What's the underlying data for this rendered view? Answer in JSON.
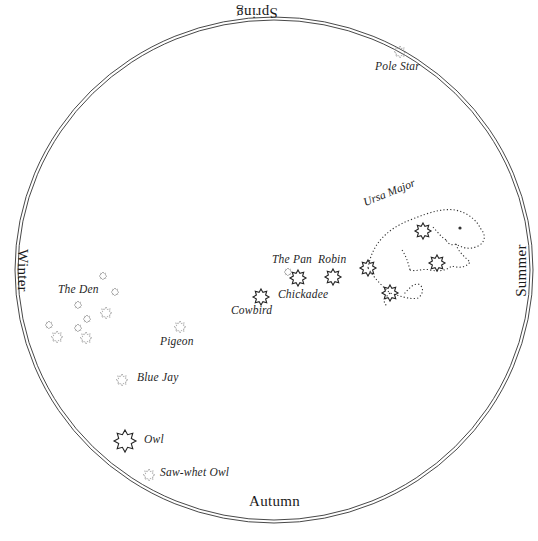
{
  "colors": {
    "ink": "#1a1a1a",
    "faint_star": "#8a8a8a",
    "bright_star": "#222222",
    "background": "#ffffff"
  },
  "seasons": {
    "spring": "Spring",
    "summer": "Summer",
    "autumn": "Autumn",
    "winter": "Winter"
  },
  "constellations": {
    "pole_star": "Pole Star",
    "ursa_major": "Ursa Major",
    "the_pan": "The Pan",
    "robin": "Robin",
    "chickadee": "Chickadee",
    "cowbird": "Cowbird",
    "the_den": "The Den",
    "pigeon": "Pigeon",
    "blue_jay": "Blue Jay",
    "owl": "Owl",
    "saw_whet_owl": "Saw-whet Owl"
  },
  "stars": [
    {
      "name": "pole-star",
      "x": 400,
      "y": 52,
      "r": 6,
      "bright": false
    },
    {
      "name": "the-pan",
      "x": 288,
      "y": 272,
      "r": 4,
      "bright": false
    },
    {
      "name": "chickadee",
      "x": 298,
      "y": 278,
      "r": 8,
      "bright": true
    },
    {
      "name": "robin",
      "x": 333,
      "y": 277,
      "r": 8,
      "bright": true
    },
    {
      "name": "cowbird",
      "x": 261,
      "y": 297,
      "r": 8,
      "bright": true
    },
    {
      "name": "pigeon",
      "x": 180,
      "y": 327,
      "r": 6,
      "bright": false
    },
    {
      "name": "blue-jay",
      "x": 122,
      "y": 380,
      "r": 6,
      "bright": false
    },
    {
      "name": "owl",
      "x": 125,
      "y": 441,
      "r": 11,
      "bright": true
    },
    {
      "name": "saw-whet-owl",
      "x": 149,
      "y": 475,
      "r": 6,
      "bright": false
    },
    {
      "name": "den-1",
      "x": 103,
      "y": 276,
      "r": 4,
      "bright": false
    },
    {
      "name": "den-2",
      "x": 115,
      "y": 292,
      "r": 4,
      "bright": false
    },
    {
      "name": "den-3",
      "x": 78,
      "y": 305,
      "r": 4,
      "bright": false
    },
    {
      "name": "den-4",
      "x": 106,
      "y": 313,
      "r": 6,
      "bright": false
    },
    {
      "name": "den-5",
      "x": 87,
      "y": 319,
      "r": 4,
      "bright": false
    },
    {
      "name": "den-6",
      "x": 49,
      "y": 325,
      "r": 4,
      "bright": false
    },
    {
      "name": "den-7",
      "x": 78,
      "y": 328,
      "r": 4,
      "bright": false
    },
    {
      "name": "den-8",
      "x": 57,
      "y": 337,
      "r": 6,
      "bright": false
    },
    {
      "name": "den-9",
      "x": 86,
      "y": 338,
      "r": 6,
      "bright": false
    },
    {
      "name": "ursa-1",
      "x": 423,
      "y": 231,
      "r": 8,
      "bright": true
    },
    {
      "name": "ursa-2",
      "x": 368,
      "y": 268,
      "r": 8,
      "bright": true
    },
    {
      "name": "ursa-3",
      "x": 437,
      "y": 263,
      "r": 8,
      "bright": true
    },
    {
      "name": "ursa-4",
      "x": 390,
      "y": 293,
      "r": 8,
      "bright": true
    }
  ]
}
